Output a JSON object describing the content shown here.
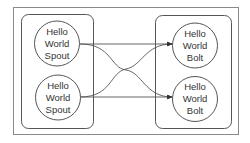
{
  "diagram": {
    "type": "topology",
    "groups": [
      {
        "id": "spouts",
        "label": ""
      },
      {
        "id": "bolts",
        "label": ""
      }
    ],
    "nodes": [
      {
        "id": "spout1",
        "group": "spouts",
        "lines": [
          "Hello",
          "World",
          "Spout"
        ]
      },
      {
        "id": "spout2",
        "group": "spouts",
        "lines": [
          "Hello",
          "World",
          "Spout"
        ]
      },
      {
        "id": "bolt1",
        "group": "bolts",
        "lines": [
          "Hello",
          "World",
          "Bolt"
        ]
      },
      {
        "id": "bolt2",
        "group": "bolts",
        "lines": [
          "Hello",
          "World",
          "Bolt"
        ]
      }
    ],
    "edges": [
      {
        "from": "spout1",
        "to": "bolt1",
        "style": "straight"
      },
      {
        "from": "spout1",
        "to": "bolt2",
        "style": "curve"
      },
      {
        "from": "spout2",
        "to": "bolt1",
        "style": "curve"
      },
      {
        "from": "spout2",
        "to": "bolt2",
        "style": "straight"
      }
    ],
    "colors": {
      "stroke": "#555555",
      "text": "#333333",
      "frame": "#8a8a8a"
    }
  }
}
